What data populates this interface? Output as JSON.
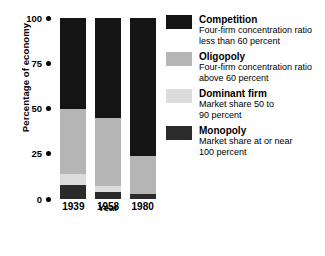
{
  "chart_data": {
    "type": "bar",
    "title": "",
    "subtitle": "",
    "xlabel": "Year",
    "ylabel": "Percentage of economy",
    "categories": [
      "1939",
      "1958",
      "1980"
    ],
    "ylim": [
      0,
      100
    ],
    "yticks": [
      "0",
      "25",
      "50",
      "75",
      "100"
    ],
    "grid": false,
    "stacked": true,
    "legend_position": "right",
    "series": [
      {
        "name": "Competition",
        "color": "#141414",
        "values": [
          50,
          55,
          76
        ]
      },
      {
        "name": "Oligopoly",
        "color": "#b5b5b5",
        "values": [
          36,
          38,
          21
        ]
      },
      {
        "name": "Dominant firm",
        "color": "#dcdcdc",
        "values": [
          6,
          3,
          0
        ]
      },
      {
        "name": "Monopoly",
        "color": "#2b2b2b",
        "values": [
          8,
          4,
          3
        ]
      }
    ]
  },
  "axis": {
    "y_title": "Percentage of economy",
    "x_title": "Year",
    "y_ticks": [
      {
        "label": "100",
        "value": 100
      },
      {
        "label": "75",
        "value": 75
      },
      {
        "label": "50",
        "value": 50
      },
      {
        "label": "25",
        "value": 25
      },
      {
        "label": "0",
        "value": 0
      }
    ],
    "x_ticks": [
      "1939",
      "1958",
      "1980"
    ]
  },
  "legend": {
    "items": [
      {
        "label": "Competition",
        "desc_line1": "Four-firm concentration ratio",
        "desc_line2": "less than 60 percent",
        "color": "#141414"
      },
      {
        "label": "Oligopoly",
        "desc_line1": "Four-firm concentration ratio",
        "desc_line2": "above 60 percent",
        "color": "#b5b5b5"
      },
      {
        "label": "Dominant firm",
        "desc_line1": "Market share 50 to",
        "desc_line2": "90 percent",
        "color": "#dcdcdc"
      },
      {
        "label": "Monopoly",
        "desc_line1": "Market share at or near",
        "desc_line2": "100 percent",
        "color": "#2b2b2b"
      }
    ]
  }
}
